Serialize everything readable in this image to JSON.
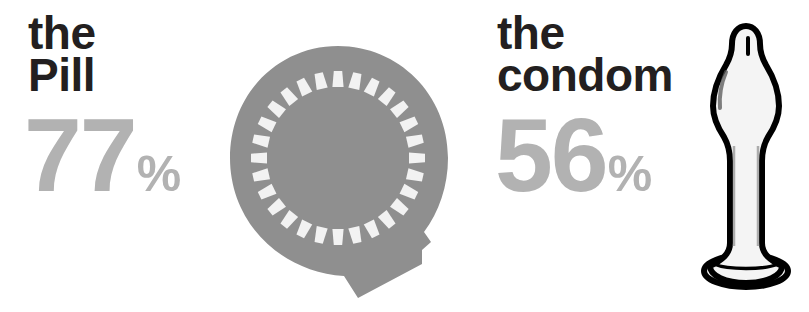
{
  "infographic": {
    "title": "Contraceptive effectiveness comparison",
    "background_color": "#ffffff",
    "heading_color": "#231f20",
    "value_color": "#b2b2b2",
    "graphic_fill_color": "#8f8f8f",
    "graphic_slot_color": "#f2f2f2",
    "outline_color": "#000000"
  },
  "stats": [
    {
      "id": "pill",
      "heading_line_1": "the",
      "heading_line_2": "Pill",
      "value": "77",
      "unit": "%",
      "icon_name": "birth-control-pill-pack-icon"
    },
    {
      "id": "condom",
      "heading_line_1": "the",
      "heading_line_2": "condom",
      "value": "56",
      "unit": "%",
      "icon_name": "condom-icon"
    }
  ],
  "chart_data": {
    "type": "bar",
    "categories": [
      "the Pill",
      "the condom"
    ],
    "values": [
      77,
      56
    ],
    "value_labels": [
      "77%",
      "56%"
    ],
    "unit": "%",
    "xlabel": "",
    "ylabel": "",
    "ylim": [
      0,
      100
    ],
    "grid": false,
    "legend": "none",
    "annotations": [
      "the Pill 77%",
      "the condom 56%"
    ]
  },
  "pill_pack": {
    "slot_count": 28,
    "has_bottom_tab": true
  }
}
